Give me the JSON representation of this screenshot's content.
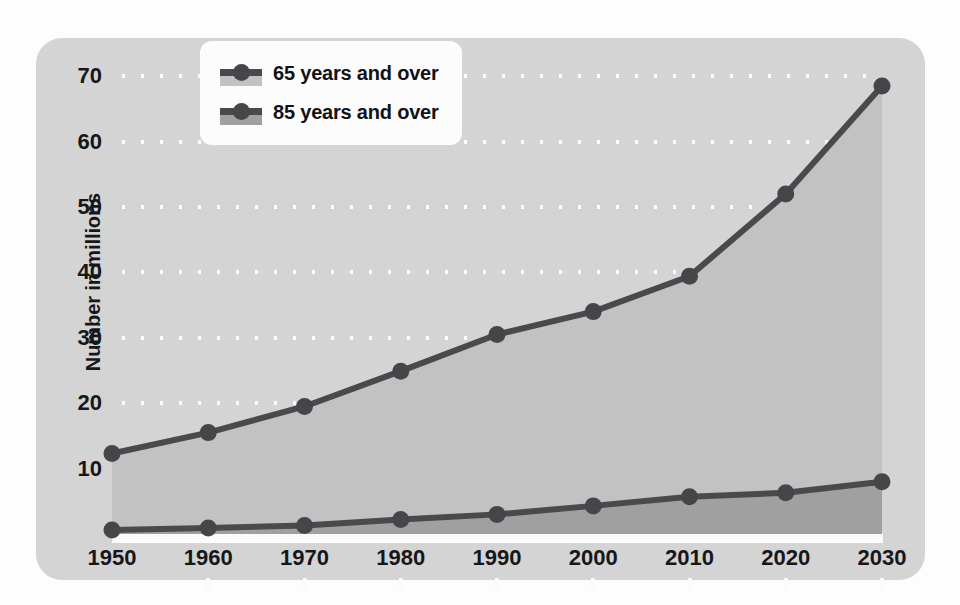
{
  "chart_data": {
    "type": "area",
    "title": "",
    "xlabel": "",
    "ylabel": "Number in millions",
    "categories": [
      "1950",
      "1960",
      "1970",
      "1980",
      "1990",
      "2000",
      "2010",
      "2020",
      "2030"
    ],
    "x": [
      1950,
      1960,
      1970,
      1980,
      1990,
      2000,
      2010,
      2020,
      2030
    ],
    "xlim": [
      1950,
      2030
    ],
    "ylim": [
      0,
      74
    ],
    "yticks": [
      10,
      20,
      30,
      40,
      50,
      60,
      70
    ],
    "ytick_labels": [
      "10",
      "20",
      "30",
      "40",
      "50",
      "60",
      "70"
    ],
    "grid": "horizontal-dotted",
    "legend_position": "top-left-inside",
    "series": [
      {
        "name": "65 years and over",
        "values": [
          12.3,
          15.5,
          19.5,
          24.9,
          30.5,
          34.0,
          39.4,
          52.0,
          68.5
        ],
        "line_color": "#4a4a4e",
        "fill_color": "#c2c2c2",
        "marker": "circle"
      },
      {
        "name": "85 years and over",
        "values": [
          0.6,
          0.9,
          1.3,
          2.2,
          3.0,
          4.3,
          5.7,
          6.3,
          8.0
        ],
        "line_color": "#4a4a4e",
        "fill_color": "#a0a0a0",
        "marker": "circle"
      }
    ]
  },
  "legend": {
    "items": [
      {
        "label": "65 years and over",
        "swatch_fill": "#c2c2c2"
      },
      {
        "label": "85 years and over",
        "swatch_fill": "#a0a0a0"
      }
    ]
  },
  "colors": {
    "panel_background": "#d4d4d4",
    "figure_background": "#fdfdfd",
    "gridline": "#ffffff",
    "axis_strip": "#fbfbfb",
    "line": "#4a4a4e",
    "marker": "#46464a",
    "text": "#17171a",
    "area_65": "#c2c2c2",
    "area_85": "#a0a0a0"
  }
}
